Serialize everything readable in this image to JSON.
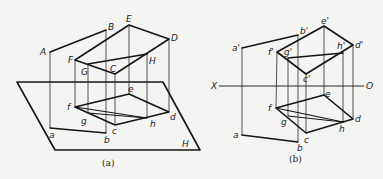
{
  "figure_a": {
    "caption": "(a)",
    "plane_label": "H",
    "upper_labels": {
      "A": "A",
      "B": "B",
      "E": "E",
      "D": "D",
      "F": "F",
      "G": "G",
      "C": "C",
      "H": "H"
    },
    "lower_labels": {
      "a": "a",
      "b": "b",
      "c": "c",
      "d": "d",
      "e": "e",
      "f": "f",
      "g": "g",
      "h": "h"
    }
  },
  "figure_b": {
    "caption": "(b)",
    "axis_labels": {
      "x": "X",
      "o": "O"
    },
    "upper_labels": {
      "a": "a'",
      "b": "b'",
      "e": "e'",
      "d": "d'",
      "f": "f'",
      "g": "g'",
      "h": "h'",
      "c": "c'"
    },
    "lower_labels": {
      "a": "a",
      "b": "b",
      "c": "c",
      "d": "d",
      "e": "e",
      "f": "f",
      "g": "g",
      "h": "h"
    }
  },
  "colors": {
    "line": "#151515",
    "background": "#f4f4f2"
  }
}
